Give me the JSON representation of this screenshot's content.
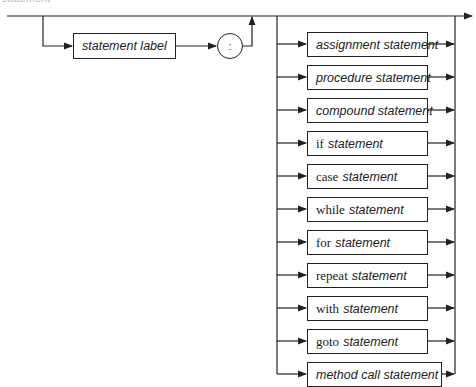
{
  "diagram": {
    "type": "syntax-diagram",
    "top_label": "statement",
    "prefix": {
      "label_box": "statement label",
      "separator": ":"
    },
    "alternatives": [
      {
        "keyword": "",
        "label": "assignment statement"
      },
      {
        "keyword": "",
        "label": "procedure statement"
      },
      {
        "keyword": "",
        "label": "compound statement"
      },
      {
        "keyword": "if",
        "label": "statement"
      },
      {
        "keyword": "case",
        "label": "statement"
      },
      {
        "keyword": "while",
        "label": "statement"
      },
      {
        "keyword": "for",
        "label": "statement"
      },
      {
        "keyword": "repeat",
        "label": "statement"
      },
      {
        "keyword": "with",
        "label": "statement"
      },
      {
        "keyword": "goto",
        "label": "statement"
      },
      {
        "keyword": "",
        "label": "method call statement"
      }
    ],
    "colors": {
      "line": "#222222",
      "background": "#ffffff"
    }
  }
}
